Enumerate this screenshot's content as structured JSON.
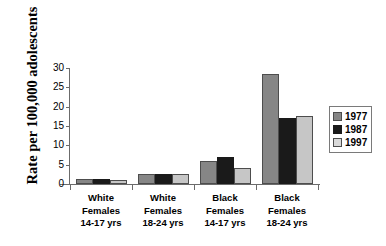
{
  "chart_data": {
    "type": "bar",
    "title": "",
    "xlabel": "",
    "ylabel": "Rate per 100,000 adolescents",
    "ylim": [
      0,
      30
    ],
    "yticks": [
      0,
      5,
      10,
      15,
      20,
      25,
      30
    ],
    "grid": false,
    "legend_position": "right",
    "categories": [
      "White Females 14-17 yrs",
      "White Females 18-24 yrs",
      "Black Females 14-17 yrs",
      "Black Females 18-24 yrs"
    ],
    "category_lines": [
      [
        "White",
        "Females",
        "14-17 yrs"
      ],
      [
        "White",
        "Females",
        "18-24 yrs"
      ],
      [
        "Black",
        "Females",
        "14-17 yrs"
      ],
      [
        "Black",
        "Females",
        "18-24 yrs"
      ]
    ],
    "series": [
      {
        "name": "1977",
        "color": "#868686",
        "values": [
          1.2,
          2.5,
          6.0,
          28.5
        ]
      },
      {
        "name": "1987",
        "color": "#1a1a1a",
        "values": [
          1.3,
          2.6,
          7.0,
          17.1
        ]
      },
      {
        "name": "1997",
        "color": "#c6c6c6",
        "values": [
          1.1,
          2.5,
          4.1,
          17.5
        ]
      }
    ]
  },
  "legend": {
    "entries": [
      {
        "label": "1977"
      },
      {
        "label": "1987"
      },
      {
        "label": "1997"
      }
    ]
  },
  "axis": {
    "y_title": "Rate per 100,000 adolescents",
    "tick_labels": [
      "0",
      "5",
      "10",
      "15",
      "20",
      "25",
      "30"
    ]
  },
  "colors": {
    "series_1977": "#868686",
    "series_1987": "#1a1a1a",
    "series_1997": "#c6c6c6",
    "axis": "#6b6b6b",
    "background": "#ffffff"
  }
}
